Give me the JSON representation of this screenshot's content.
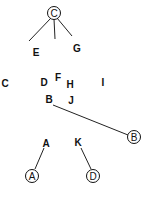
{
  "diagram": {
    "circled_nodes": [
      {
        "id": "C",
        "label": "C"
      },
      {
        "id": "B",
        "label": "B"
      },
      {
        "id": "A",
        "label": "A"
      },
      {
        "id": "D",
        "label": "D"
      }
    ],
    "labels": [
      {
        "id": "E",
        "text": "E"
      },
      {
        "id": "G",
        "text": "G"
      },
      {
        "id": "C",
        "text": "C"
      },
      {
        "id": "D",
        "text": "D"
      },
      {
        "id": "F",
        "text": "F"
      },
      {
        "id": "H",
        "text": "H"
      },
      {
        "id": "I",
        "text": "I"
      },
      {
        "id": "B",
        "text": "B"
      },
      {
        "id": "J",
        "text": "J"
      },
      {
        "id": "A",
        "text": "A"
      },
      {
        "id": "K",
        "text": "K"
      }
    ],
    "edges": [
      {
        "from": "circle-C",
        "to": "E"
      },
      {
        "from": "circle-C",
        "to": "unlabeled-middle"
      },
      {
        "from": "circle-C",
        "to": "G"
      },
      {
        "from": "label-B",
        "to": "circle-B"
      },
      {
        "from": "label-A",
        "to": "circle-A"
      },
      {
        "from": "label-K",
        "to": "circle-D"
      }
    ]
  }
}
